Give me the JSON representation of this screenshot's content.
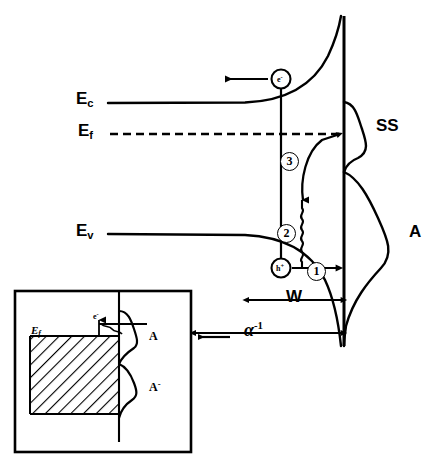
{
  "figure": {
    "ink_color": "#000000",
    "background": "#ffffff"
  },
  "band_labels": {
    "conduction": "E",
    "conduction_sub": "c",
    "fermi": "E",
    "fermi_sub": "f",
    "valence": "E",
    "valence_sub": "v"
  },
  "peak_labels": {
    "surface_states": "SS",
    "acceptor": "A"
  },
  "dimension_labels": {
    "depletion_width": "W",
    "absorption_depth": "α",
    "absorption_depth_sup": "-1"
  },
  "carriers": {
    "electron": "e",
    "electron_sup": "-",
    "hole": "h",
    "hole_sup": "+"
  },
  "process_numbers": {
    "one": "1",
    "two": "2",
    "three": "3"
  },
  "inset": {
    "fermi": "E",
    "fermi_sub": "f",
    "peak_neutral": "A",
    "peak_charged": "A",
    "peak_charged_sup": "-",
    "electron": "e",
    "electron_sup": "-"
  }
}
